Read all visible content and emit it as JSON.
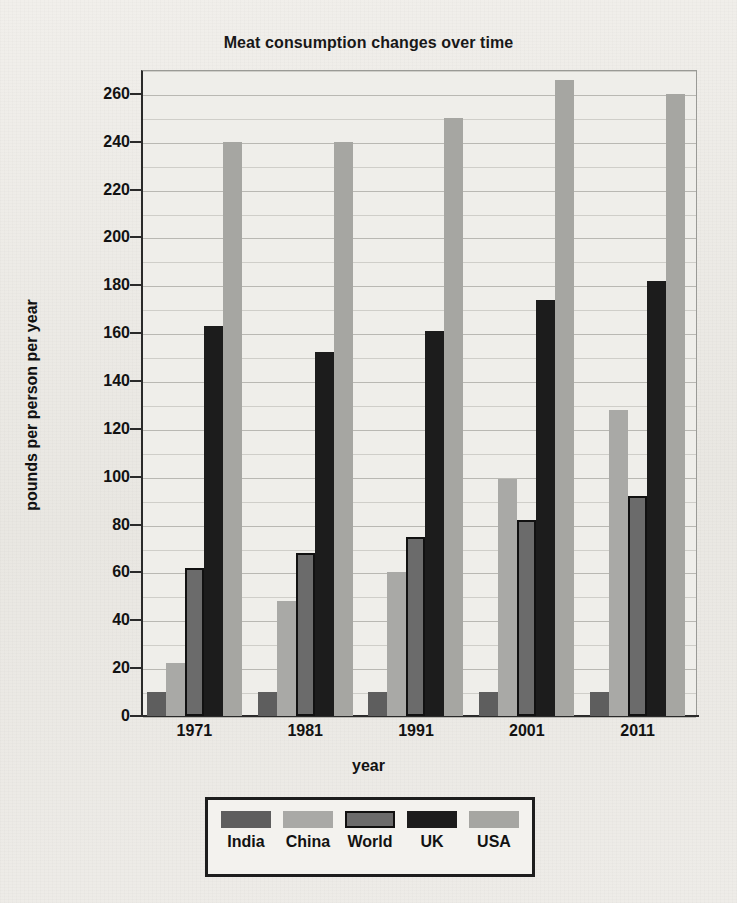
{
  "chart_data": {
    "type": "bar",
    "title": "Meat consumption changes over time",
    "xlabel": "year",
    "ylabel": "pounds per person per year",
    "categories": [
      "1971",
      "1981",
      "1991",
      "2001",
      "2011"
    ],
    "ylim": [
      0,
      270
    ],
    "yticks": [
      0,
      20,
      40,
      60,
      80,
      100,
      120,
      140,
      160,
      180,
      200,
      220,
      240,
      260
    ],
    "minor_tick_step": 10,
    "grid": true,
    "legend_position": "bottom",
    "series": [
      {
        "name": "India",
        "color": "#5e5e5e",
        "border": "none",
        "values": [
          10,
          10,
          10,
          10,
          10
        ]
      },
      {
        "name": "China",
        "color": "#a9a9a6",
        "border": "none",
        "values": [
          22,
          48,
          60,
          99,
          128
        ]
      },
      {
        "name": "World",
        "color": "#6b6b6b",
        "border": "#111111",
        "values": [
          62,
          68,
          75,
          82,
          92
        ]
      },
      {
        "name": "UK",
        "color": "#1c1c1c",
        "border": "none",
        "values": [
          163,
          152,
          161,
          174,
          182
        ]
      },
      {
        "name": "USA",
        "color": "#a6a6a2",
        "border": "none",
        "values": [
          240,
          240,
          250,
          266,
          260
        ]
      }
    ]
  },
  "legend": {
    "items": [
      {
        "label": "India"
      },
      {
        "label": "China"
      },
      {
        "label": "World"
      },
      {
        "label": "UK"
      },
      {
        "label": "USA"
      }
    ]
  }
}
